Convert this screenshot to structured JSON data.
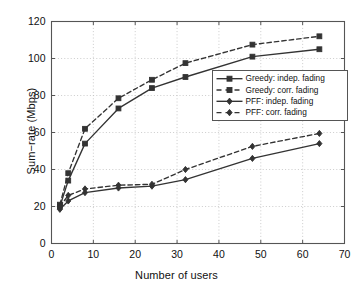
{
  "chart_data": {
    "type": "line",
    "title": "",
    "xlabel": "Number of users",
    "ylabel": "Sum−rate (Mbps)",
    "xlim": [
      0,
      70
    ],
    "ylim": [
      0,
      120
    ],
    "xticks": [
      0,
      10,
      20,
      30,
      40,
      50,
      60,
      70
    ],
    "yticks": [
      0,
      20,
      40,
      60,
      80,
      100,
      120
    ],
    "grid": true,
    "grid_style": "dotted",
    "legend_position": "center-right",
    "x": [
      2,
      4,
      8,
      16,
      24,
      32,
      48,
      64
    ],
    "series": [
      {
        "name": "Greedy: indep. fading",
        "label": "Greedy: indep. fading",
        "marker": "square",
        "linestyle": "solid",
        "color": "#333333",
        "values": [
          20,
          34,
          54,
          73,
          84,
          90,
          101,
          105
        ]
      },
      {
        "name": "Greedy: corr. fading",
        "label": "Greedy: corr. fading",
        "marker": "square",
        "linestyle": "dashed",
        "color": "#333333",
        "values": [
          21,
          38,
          62,
          78.5,
          88.5,
          97.5,
          107.5,
          112
        ]
      },
      {
        "name": "PFF: indep. fading",
        "label": "PFF: indep. fading",
        "marker": "diamond",
        "linestyle": "solid",
        "color": "#333333",
        "values": [
          18.5,
          23,
          27.5,
          30,
          31,
          34.5,
          46,
          54
        ]
      },
      {
        "name": "PFF: corr. fading",
        "label": "PFF: corr. fading",
        "marker": "diamond",
        "linestyle": "dashed",
        "color": "#333333",
        "values": [
          20,
          26,
          29.5,
          31.5,
          32,
          40,
          52.5,
          59.5
        ]
      }
    ]
  },
  "axes": {
    "xtick_labels": [
      "0",
      "10",
      "20",
      "30",
      "40",
      "50",
      "60",
      "70"
    ],
    "ytick_labels": [
      "0",
      "20",
      "40",
      "60",
      "80",
      "100",
      "120"
    ],
    "xlabel": "Number of users",
    "ylabel": "Sum−rate (Mbps)"
  },
  "legend": {
    "items": [
      {
        "label": "Greedy: indep. fading",
        "marker": "square",
        "linestyle": "solid"
      },
      {
        "label": "Greedy: corr. fading",
        "marker": "square",
        "linestyle": "dashed"
      },
      {
        "label": "PFF: indep. fading",
        "marker": "diamond",
        "linestyle": "solid"
      },
      {
        "label": "PFF: corr. fading",
        "marker": "diamond",
        "linestyle": "dashed"
      }
    ]
  },
  "style": {
    "line_color": "#333333",
    "axis_color": "#555555",
    "grid_color": "#bfbfbf",
    "background": "#ffffff"
  }
}
